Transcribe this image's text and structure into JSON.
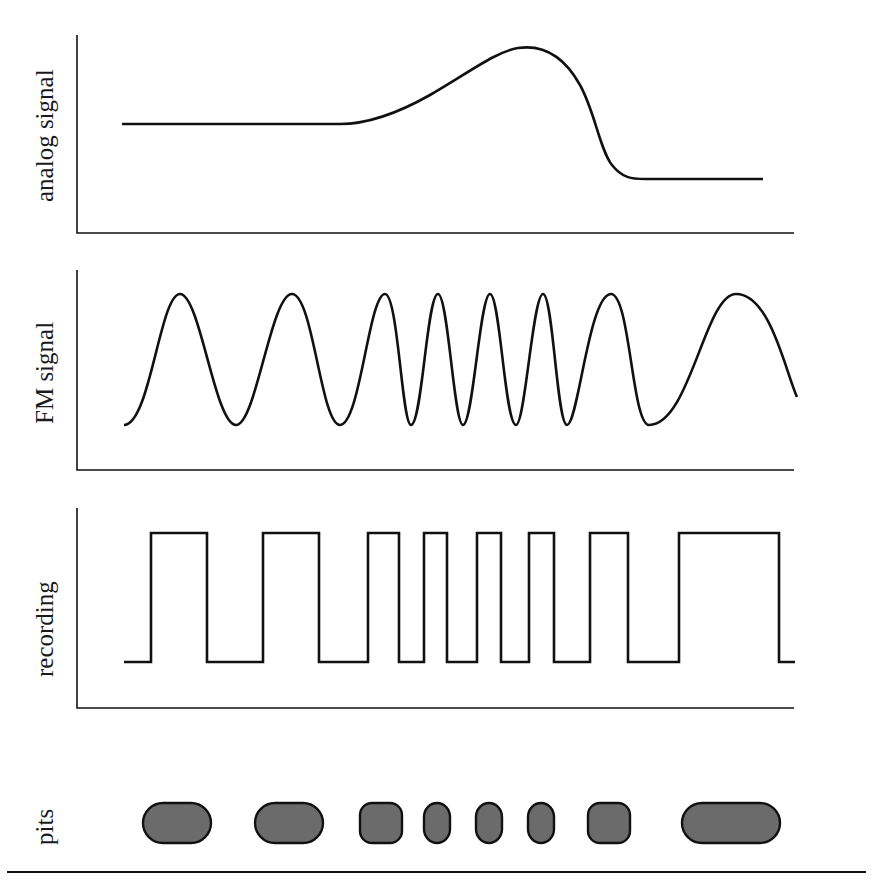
{
  "figure": {
    "panels": [
      {
        "id": "analog",
        "label": "analog signal",
        "description": "flat level, smooth rise to a peak, sharp drop to a lower flat level"
      },
      {
        "id": "fm",
        "label": "FM signal",
        "description": "sinusoid whose frequency increases with analog signal amplitude"
      },
      {
        "id": "recording",
        "label": "recording",
        "description": "square wave derived from FM signal zero crossings"
      },
      {
        "id": "pits",
        "label": "pits",
        "description": "rounded pits whose lengths match the high portions of the recording"
      }
    ],
    "pits": [
      {
        "cx": 177,
        "w": 68
      },
      {
        "cx": 289,
        "w": 68
      },
      {
        "cx": 381,
        "w": 42
      },
      {
        "cx": 437,
        "w": 27
      },
      {
        "cx": 489,
        "w": 26
      },
      {
        "cx": 541,
        "w": 26
      },
      {
        "cx": 608,
        "w": 42
      },
      {
        "cx": 731,
        "w": 98
      }
    ],
    "colors": {
      "stroke": "#111111",
      "pit_fill": "#6b6b6b",
      "background": "#ffffff"
    }
  }
}
